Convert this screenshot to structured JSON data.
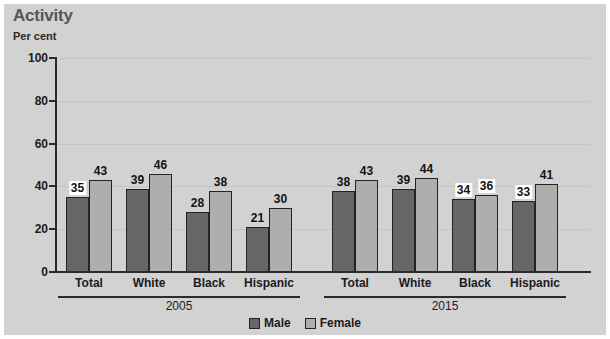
{
  "header": {
    "title": "Activity",
    "subtitle": "Per cent"
  },
  "legend": {
    "items": [
      {
        "label": "Male",
        "key": "male",
        "color": "#666666"
      },
      {
        "label": "Female",
        "key": "female",
        "color": "#aeaeae"
      }
    ]
  },
  "axis": {
    "y_ticks": [
      "0",
      "20",
      "40",
      "60",
      "80",
      "100"
    ]
  },
  "groups": [
    {
      "year": "2005",
      "categories": [
        "Total",
        "White",
        "Black",
        "Hispanic"
      ]
    },
    {
      "year": "2015",
      "categories": [
        "Total",
        "White",
        "Black",
        "Hispanic"
      ]
    }
  ],
  "chart_data": {
    "type": "bar",
    "title": "Activity",
    "subtitle": "Per cent",
    "xlabel": "",
    "ylabel": "Per cent",
    "ylim": [
      0,
      100
    ],
    "yticks": [
      0,
      20,
      40,
      60,
      80,
      100
    ],
    "grid": true,
    "legend_position": "bottom-center",
    "group_labels": [
      "2005",
      "2015"
    ],
    "categories": [
      "2005 Total",
      "2005 White",
      "2005 Black",
      "2005 Hispanic",
      "2015 Total",
      "2015 White",
      "2015 Black",
      "2015 Hispanic"
    ],
    "series": [
      {
        "name": "Male",
        "color": "#666666",
        "values": [
          35,
          39,
          28,
          21,
          38,
          39,
          34,
          33
        ]
      },
      {
        "name": "Female",
        "color": "#aeaeae",
        "values": [
          43,
          46,
          38,
          30,
          43,
          44,
          36,
          41
        ]
      }
    ],
    "data_labels": {
      "Male": [
        "35",
        "39",
        "28",
        "21",
        "38",
        "39",
        "34",
        "33"
      ],
      "Female": [
        "43",
        "46",
        "38",
        "30",
        "43",
        "44",
        "36",
        "41"
      ]
    },
    "boxed_labels": [
      "2005 Total Male",
      "2015 Black Male",
      "2015 Black Female",
      "2015 Hispanic Male"
    ]
  }
}
